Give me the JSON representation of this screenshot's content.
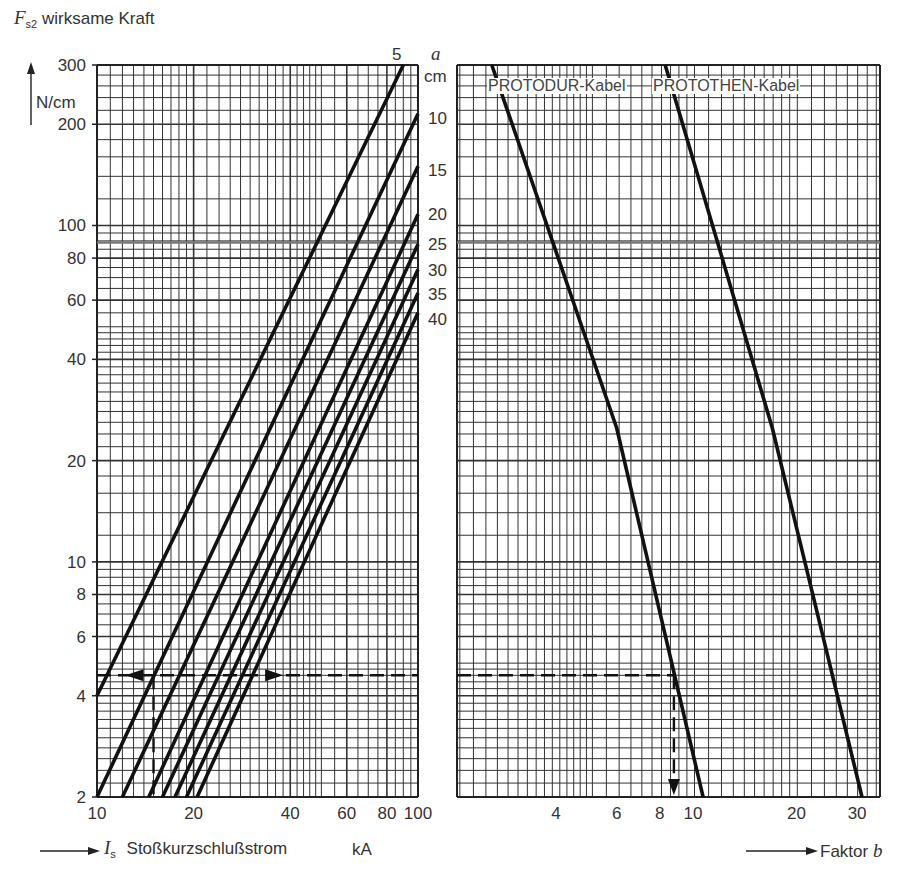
{
  "chart_data": [
    {
      "type": "line",
      "title": "",
      "ylabel": "F_s2 wirksame Kraft",
      "yunit": "N/cm",
      "xlabel": "I_s Stoßkurzschlußstrom",
      "xunit": "kA",
      "xscale": "log",
      "yscale": "log",
      "xlim": [
        10,
        100
      ],
      "ylim": [
        2,
        300
      ],
      "xticks": [
        10,
        20,
        40,
        60,
        80,
        100
      ],
      "yticks": [
        2,
        4,
        6,
        8,
        10,
        20,
        40,
        60,
        80,
        100,
        200,
        300
      ],
      "grid": true,
      "legend_title": "a cm",
      "series": [
        {
          "name": "5",
          "points": [
            [
              10,
              4
            ],
            [
              90,
              300
            ]
          ]
        },
        {
          "name": "10",
          "points": [
            [
              10,
              2
            ],
            [
              100,
              215
            ]
          ]
        },
        {
          "name": "15",
          "points": [
            [
              12,
              2
            ],
            [
              100,
              150
            ]
          ]
        },
        {
          "name": "20",
          "points": [
            [
              14.5,
              2
            ],
            [
              100,
              108
            ]
          ]
        },
        {
          "name": "25",
          "points": [
            [
              16,
              2
            ],
            [
              100,
              88
            ]
          ]
        },
        {
          "name": "30",
          "points": [
            [
              17.5,
              2
            ],
            [
              100,
              74
            ]
          ]
        },
        {
          "name": "35",
          "points": [
            [
              19,
              2
            ],
            [
              100,
              63
            ]
          ]
        },
        {
          "name": "40",
          "points": [
            [
              20.5,
              2
            ],
            [
              100,
              55
            ]
          ]
        }
      ],
      "annotations": [
        {
          "type": "dashed-arrow",
          "description": "horizontal reading line at F≈4.6 N/cm from I≈15 kA to both sides"
        },
        {
          "type": "dashed-line",
          "description": "vertical reading line at I≈15 kA"
        }
      ]
    },
    {
      "type": "line",
      "xlabel": "Faktor b",
      "xscale": "log",
      "yscale": "log",
      "xlim": [
        2,
        35
      ],
      "ylim": [
        2,
        300
      ],
      "xticks": [
        4,
        6,
        8,
        10,
        20,
        30
      ],
      "grid": true,
      "series": [
        {
          "name": "PROTODUR-Kabel",
          "points": [
            [
              2.6,
              300
            ],
            [
              6,
              25
            ],
            [
              10.7,
              2
            ]
          ]
        },
        {
          "name": "PROTOTHEN-Kabel",
          "points": [
            [
              8.3,
              300
            ],
            [
              17,
              25
            ],
            [
              31,
              2
            ]
          ]
        }
      ],
      "annotations": [
        {
          "type": "dashed-arrow",
          "description": "horizontal line at F≈4.6 N/cm to PROTODUR curve, then down to b≈8.8"
        }
      ]
    }
  ],
  "labels": {
    "y_axis_title_symbol": "F",
    "y_axis_title_sub": "s2",
    "y_axis_title_text": "wirksame Kraft",
    "y_unit": "N/cm",
    "x_axis_title_symbol": "I",
    "x_axis_title_sub": "s",
    "x_axis_title_text": "Stoßkurzschlußstrom",
    "x_unit": "kA",
    "x2_axis_title": "Faktor",
    "x2_axis_symbol": "b",
    "a_symbol": "a",
    "a_unit": "cm",
    "legend_protodur": "PROTODUR-Kabel",
    "legend_protothen": "PROTOTHEN-Kabel"
  },
  "y_ticks": [
    {
      "v": 300,
      "t": "300"
    },
    {
      "v": 200,
      "t": "200"
    },
    {
      "v": 100,
      "t": "100"
    },
    {
      "v": 80,
      "t": "80"
    },
    {
      "v": 60,
      "t": "60"
    },
    {
      "v": 40,
      "t": "40"
    },
    {
      "v": 20,
      "t": "20"
    },
    {
      "v": 10,
      "t": "10"
    },
    {
      "v": 8,
      "t": "8"
    },
    {
      "v": 6,
      "t": "6"
    },
    {
      "v": 4,
      "t": "4"
    },
    {
      "v": 2,
      "t": "2"
    }
  ],
  "x_ticks_left": [
    {
      "v": 10,
      "t": "10"
    },
    {
      "v": 20,
      "t": "20"
    },
    {
      "v": 40,
      "t": "40"
    },
    {
      "v": 60,
      "t": "60"
    },
    {
      "v": 80,
      "t": "80"
    },
    {
      "v": 100,
      "t": "100"
    }
  ],
  "x_ticks_right": [
    {
      "v": 4,
      "t": "4"
    },
    {
      "v": 6,
      "t": "6"
    },
    {
      "v": 8,
      "t": "8"
    },
    {
      "v": 10,
      "t": "10"
    },
    {
      "v": 20,
      "t": "20"
    },
    {
      "v": 30,
      "t": "30"
    }
  ],
  "a_labels": [
    "5",
    "10",
    "15",
    "20",
    "25",
    "30",
    "35",
    "40"
  ]
}
